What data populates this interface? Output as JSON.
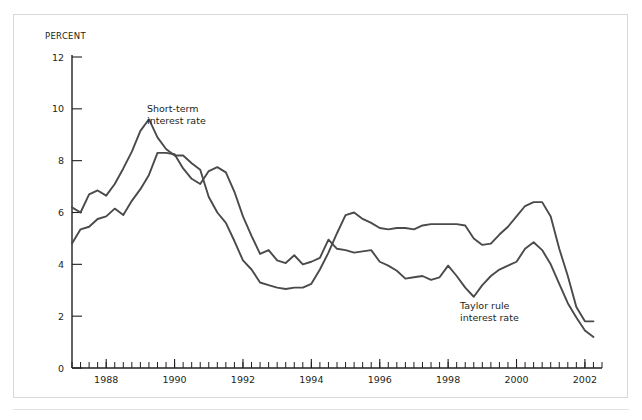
{
  "figure": {
    "background_color": "#ffffff",
    "frame_color": "#d8d8d8",
    "line_color": "#4a4a4a",
    "text_color": "#231f20"
  },
  "chart_data": {
    "type": "line",
    "title": "",
    "subtitle": "",
    "xlabel": "",
    "ylabel": "PERCENT",
    "ylim": [
      0,
      12
    ],
    "xlim": [
      1987.0,
      2002.5
    ],
    "yticks": [
      0,
      2,
      4,
      6,
      8,
      10,
      12
    ],
    "ytick_labels": [
      "0",
      "2",
      "4",
      "6",
      "8",
      "10",
      "12"
    ],
    "xticks": [
      1988,
      1990,
      1992,
      1994,
      1996,
      1998,
      2000,
      2002
    ],
    "xtick_labels": [
      "1988",
      "1990",
      "1992",
      "1994",
      "1996",
      "1998",
      "2000",
      "2002"
    ],
    "x_minor_tick_interval": 0.25,
    "grid": false,
    "legend_position": "inline-annotation",
    "x": [
      1987.0,
      1987.25,
      1987.5,
      1987.75,
      1988.0,
      1988.25,
      1988.5,
      1988.75,
      1989.0,
      1989.25,
      1989.5,
      1989.75,
      1990.0,
      1990.25,
      1990.5,
      1990.75,
      1991.0,
      1991.25,
      1991.5,
      1991.75,
      1992.0,
      1992.25,
      1992.5,
      1992.75,
      1993.0,
      1993.25,
      1993.5,
      1993.75,
      1994.0,
      1994.25,
      1994.5,
      1994.75,
      1995.0,
      1995.25,
      1995.5,
      1995.75,
      1996.0,
      1996.25,
      1996.5,
      1996.75,
      1997.0,
      1997.25,
      1997.5,
      1997.75,
      1998.0,
      1998.25,
      1998.5,
      1998.75,
      1999.0,
      1999.25,
      1999.5,
      1999.75,
      2000.0,
      2000.25,
      2000.5,
      2000.75,
      2001.0,
      2001.25,
      2001.5,
      2001.75,
      2002.0,
      2002.25
    ],
    "series": [
      {
        "name": "Short-term interest rate",
        "label": "Short-term\ninterest rate",
        "label_line1": "Short-term",
        "label_line2": "interest rate",
        "color": "#4a4a4a",
        "values": [
          6.2,
          6.0,
          6.7,
          6.85,
          6.65,
          7.1,
          7.7,
          8.35,
          9.15,
          9.6,
          8.9,
          8.45,
          8.2,
          8.2,
          7.9,
          7.65,
          6.6,
          6.0,
          5.6,
          4.9,
          4.15,
          3.8,
          3.3,
          3.2,
          3.1,
          3.05,
          3.1,
          3.1,
          3.25,
          3.8,
          4.45,
          5.2,
          5.9,
          6.0,
          5.75,
          5.6,
          5.4,
          5.35,
          5.4,
          5.4,
          5.35,
          5.5,
          5.55,
          5.55,
          5.55,
          5.55,
          5.5,
          5.0,
          4.75,
          4.8,
          5.15,
          5.45,
          5.85,
          6.25,
          6.4,
          6.4,
          5.85,
          4.6,
          3.55,
          2.35,
          1.8,
          1.8
        ]
      },
      {
        "name": "Taylor rule interest rate",
        "label": "Taylor rule\ninterest rate",
        "label_line1": "Taylor rule",
        "label_line2": "interest rate",
        "color": "#4a4a4a",
        "values": [
          4.8,
          5.35,
          5.45,
          5.75,
          5.85,
          6.15,
          5.9,
          6.45,
          6.9,
          7.45,
          8.3,
          8.3,
          8.25,
          7.7,
          7.3,
          7.1,
          7.6,
          7.75,
          7.55,
          6.8,
          5.85,
          5.1,
          4.4,
          4.55,
          4.15,
          4.05,
          4.35,
          4.0,
          4.1,
          4.25,
          4.95,
          4.6,
          4.55,
          4.45,
          4.5,
          4.55,
          4.1,
          3.95,
          3.75,
          3.45,
          3.5,
          3.55,
          3.4,
          3.5,
          3.95,
          3.55,
          3.1,
          2.75,
          3.2,
          3.55,
          3.8,
          3.95,
          4.1,
          4.6,
          4.85,
          4.55,
          4.0,
          3.25,
          2.5,
          1.95,
          1.45,
          1.2
        ]
      }
    ],
    "annotations": [
      {
        "text_line1": "Short-term",
        "text_line2": "interest rate",
        "x_px": 147,
        "y_px": 112
      },
      {
        "text_line1": "Taylor rule",
        "text_line2": "interest rate",
        "x_px": 460,
        "y_px": 309
      }
    ]
  }
}
